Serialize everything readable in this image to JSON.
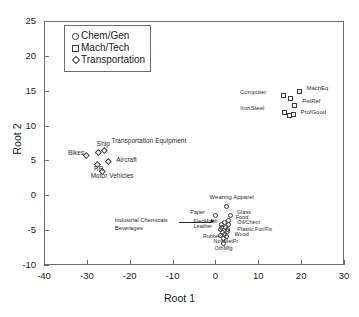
{
  "chart_data": {
    "type": "scatter",
    "title": "",
    "xlabel": "Root 1",
    "ylabel": "Root 2",
    "xlim": [
      -40,
      30
    ],
    "ylim": [
      -10,
      25
    ],
    "xticks": [
      -40,
      -30,
      -20,
      -10,
      0,
      10,
      20,
      30
    ],
    "yticks": [
      -10,
      -5,
      0,
      5,
      10,
      15,
      20,
      25
    ],
    "grid": false,
    "legend_position": "upper-left-inside",
    "series": [
      {
        "name": "Chem/Gen",
        "marker": "circle",
        "points": [
          {
            "label": "Paper",
            "x": 0.2,
            "y": -3.0,
            "label_dx": -26,
            "label_dy": -3
          },
          {
            "label": "Wearing Apparel",
            "x": 2.6,
            "y": -1.7,
            "label_dx": -17,
            "label_dy": -9
          },
          {
            "label": "Glass",
            "x": 3.6,
            "y": -2.9,
            "label_dx": 6,
            "label_dy": -3
          },
          {
            "label": "Food",
            "x": 3.1,
            "y": -3.6,
            "label_dx": 7,
            "label_dy": -2
          },
          {
            "label": "Oil/Chem",
            "x": 3.2,
            "y": -4.3,
            "label_dx": 8,
            "label_dy": -2
          },
          {
            "label": "Plastic Fur/Fix",
            "x": 3.0,
            "y": -5.2,
            "label_dx": 9,
            "label_dy": -2
          },
          {
            "label": "Wood",
            "x": 2.6,
            "y": -5.9,
            "label_dx": 8,
            "label_dy": -1
          },
          {
            "label": "ElecMach",
            "x": 1.4,
            "y": -4.2,
            "label_dx": -28,
            "label_dy": -3
          },
          {
            "label": "Leather",
            "x": 1.2,
            "y": -4.9,
            "label_dx": -27,
            "label_dy": -2
          },
          {
            "label": "Rubber",
            "x": 1.3,
            "y": -5.8,
            "label_dx": -18,
            "label_dy": 1
          },
          {
            "label": "NonMetPr",
            "x": 1.9,
            "y": -6.3,
            "label_dx": -10,
            "label_dy": 3
          },
          {
            "label": "OthMfg",
            "x": 1.9,
            "y": -6.9,
            "label_dx": -9,
            "label_dy": 6
          },
          {
            "label": "",
            "x": 2.2,
            "y": -4.0,
            "label_dx": 0,
            "label_dy": 0
          },
          {
            "label": "",
            "x": 2.5,
            "y": -4.7,
            "label_dx": 0,
            "label_dy": 0
          },
          {
            "label": "",
            "x": 1.8,
            "y": -5.4,
            "label_dx": 0,
            "label_dy": 0
          },
          {
            "label": "",
            "x": 2.9,
            "y": -4.9,
            "label_dx": 0,
            "label_dy": 0
          },
          {
            "label": "",
            "x": 2.3,
            "y": -5.6,
            "label_dx": 0,
            "label_dy": 0
          },
          {
            "label": "",
            "x": 1.6,
            "y": -4.7,
            "label_dx": 0,
            "label_dy": 0
          }
        ]
      },
      {
        "name": "Mach/Tech",
        "marker": "square",
        "points": [
          {
            "label": "MachEq",
            "x": 19.6,
            "y": 14.8,
            "label_dx": 7,
            "label_dy": -3
          },
          {
            "label": "",
            "x": 17.7,
            "y": 13.8,
            "label_dx": 0,
            "label_dy": 0
          },
          {
            "label": "PetRef",
            "x": 18.6,
            "y": 12.9,
            "label_dx": 7,
            "label_dy": -3
          },
          {
            "label": "ProfGood",
            "x": 18.2,
            "y": 11.6,
            "label_dx": 7,
            "label_dy": -1
          },
          {
            "label": "",
            "x": 17.4,
            "y": 11.4,
            "label_dx": 0,
            "label_dy": 0
          },
          {
            "label": "Computer",
            "x": 16.0,
            "y": 14.2,
            "label_dx": -44,
            "label_dy": -3
          },
          {
            "label": "IronSteel",
            "x": 16.3,
            "y": 11.9,
            "label_dx": -45,
            "label_dy": -3
          }
        ]
      },
      {
        "name": "Transportation",
        "marker": "diamond",
        "points": [
          {
            "label": "Ship",
            "x": -27.2,
            "y": 6.1,
            "label_dx": -2,
            "label_dy": -9
          },
          {
            "label": "Transportation Equipment",
            "x": -25.9,
            "y": 6.4,
            "label_dx": 7,
            "label_dy": -10
          },
          {
            "label": "Bikes",
            "x": -29.9,
            "y": 5.7,
            "label_dx": -19,
            "label_dy": -3
          },
          {
            "label": "Aircraft",
            "x": -24.8,
            "y": 4.8,
            "label_dx": 7,
            "label_dy": -2
          },
          {
            "label": "RR",
            "x": -27.4,
            "y": 4.4,
            "label_dx": -4,
            "label_dy": 4
          },
          {
            "label": "Motor Vehicles",
            "x": -26.3,
            "y": 3.3,
            "label_dx": -12,
            "label_dy": 4
          }
        ]
      }
    ],
    "annotations": [
      {
        "text_line1": "Industrial Chemicals",
        "text_line2": "Beverages",
        "x_text": -16.5,
        "y_text": -4.3,
        "x_target": 0.4,
        "y_target": -4.6
      }
    ]
  },
  "legend": {
    "entries": [
      {
        "label": "Chem/Gen",
        "symbol": "circle-marker-icon"
      },
      {
        "label": "Mach/Tech",
        "symbol": "square-marker-icon"
      },
      {
        "label": "Transportation",
        "symbol": "diamond-marker-icon"
      }
    ]
  },
  "caption": ""
}
